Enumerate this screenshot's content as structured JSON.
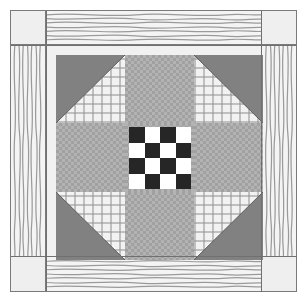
{
  "artwork": {
    "title": "Patchwork Quilt Block",
    "pattern_name": "Shoofly Star with Checkerboard Center",
    "canvas": {
      "width": 307,
      "height": 301,
      "background": "#ffffff"
    },
    "frame": {
      "border_color": "#6d6d6d",
      "fill": "#f1f1f1"
    }
  },
  "palette": {
    "background": "#ffffff",
    "frame_line": "#6d6d6d",
    "seam_line": "#707070",
    "corner_square": "#efefef",
    "sash_base": "#f4f4f4",
    "sash_grain": "#9a9a9a",
    "solid_gray": "#818181",
    "gray_check_light": "#b3b3b3",
    "gray_check_dark": "#a1a1a1",
    "gingham_base": "#f2f2f2",
    "gingham_line": "#969696",
    "checker_dark": "#262626",
    "checker_light": "#ffffff"
  },
  "border": {
    "corners": [
      {
        "position": "top-left",
        "fabric": "plain-light"
      },
      {
        "position": "top-right",
        "fabric": "plain-light"
      },
      {
        "position": "bottom-left",
        "fabric": "plain-light"
      },
      {
        "position": "bottom-right",
        "fabric": "plain-light"
      }
    ],
    "sashing": [
      {
        "position": "top",
        "fabric": "wavy-grain",
        "grain": "horizontal"
      },
      {
        "position": "bottom",
        "fabric": "wavy-grain",
        "grain": "horizontal"
      },
      {
        "position": "left",
        "fabric": "wavy-grain",
        "grain": "vertical"
      },
      {
        "position": "right",
        "fabric": "wavy-grain",
        "grain": "vertical"
      }
    ]
  },
  "block": {
    "grid": "3x3",
    "cells": [
      {
        "index": 0,
        "position": "top-left",
        "type": "half-square-triangle",
        "solid_corner": "top-left",
        "fabrics": [
          "solid_gray",
          "gingham"
        ]
      },
      {
        "index": 1,
        "position": "top-center",
        "type": "plain",
        "fabrics": [
          "gray_check"
        ]
      },
      {
        "index": 2,
        "position": "top-right",
        "type": "half-square-triangle",
        "solid_corner": "top-right",
        "fabrics": [
          "solid_gray",
          "gingham"
        ]
      },
      {
        "index": 3,
        "position": "middle-left",
        "type": "plain",
        "fabrics": [
          "gray_check"
        ]
      },
      {
        "index": 4,
        "position": "center",
        "type": "checkerboard-4x4",
        "fabrics": [
          "checker_dark",
          "checker_light"
        ]
      },
      {
        "index": 5,
        "position": "middle-right",
        "type": "plain",
        "fabrics": [
          "gray_check"
        ]
      },
      {
        "index": 6,
        "position": "bottom-left",
        "type": "half-square-triangle",
        "solid_corner": "bottom-left",
        "fabrics": [
          "solid_gray",
          "gingham"
        ]
      },
      {
        "index": 7,
        "position": "bottom-center",
        "type": "plain",
        "fabrics": [
          "gray_check"
        ]
      },
      {
        "index": 8,
        "position": "bottom-right",
        "type": "half-square-triangle",
        "solid_corner": "bottom-right",
        "fabrics": [
          "solid_gray",
          "gingham"
        ]
      }
    ]
  },
  "checkerboard": {
    "rows": 4,
    "columns": 4,
    "start_color": "dark",
    "squares": [
      [
        "dark",
        "light",
        "dark",
        "light"
      ],
      [
        "light",
        "dark",
        "light",
        "dark"
      ],
      [
        "dark",
        "light",
        "dark",
        "light"
      ],
      [
        "light",
        "dark",
        "light",
        "dark"
      ]
    ]
  }
}
